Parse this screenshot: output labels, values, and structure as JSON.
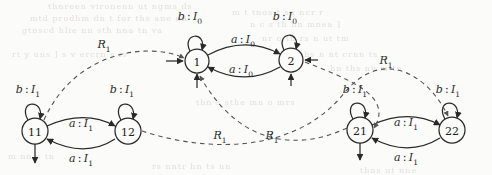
{
  "figure": {
    "type": "state-transition-diagram",
    "colors": {
      "background": "#fbfbf9",
      "stroke": "#2a2a2a",
      "text": "#2a2a2a",
      "bleedthrough": "#e2e0dc"
    }
  },
  "nodes": [
    {
      "id": "n1",
      "label": "1",
      "x": 197,
      "y": 61,
      "r": 12
    },
    {
      "id": "n2",
      "label": "2",
      "x": 291,
      "y": 60,
      "r": 12
    },
    {
      "id": "n11",
      "label": "11",
      "x": 35,
      "y": 131,
      "r": 13
    },
    {
      "id": "n12",
      "label": "12",
      "x": 128,
      "y": 131,
      "r": 13
    },
    {
      "id": "n21",
      "label": "21",
      "x": 360,
      "y": 130,
      "r": 13
    },
    {
      "id": "n22",
      "label": "22",
      "x": 452,
      "y": 130,
      "r": 13
    }
  ],
  "edge_labels": [
    {
      "id": "loop-1",
      "symbol": "b",
      "io": "I",
      "sub": "0",
      "x": 190,
      "y": 18
    },
    {
      "id": "loop-2",
      "symbol": "b",
      "io": "I",
      "sub": "0",
      "x": 285,
      "y": 18
    },
    {
      "id": "top-1to2",
      "symbol": "a",
      "io": "I",
      "sub": "0",
      "x": 243,
      "y": 41
    },
    {
      "id": "bot-2to1",
      "symbol": "a",
      "io": "I",
      "sub": "0",
      "x": 241,
      "y": 71
    },
    {
      "id": "loop-11",
      "symbol": "b",
      "io": "I",
      "sub": "1",
      "x": 28,
      "y": 91
    },
    {
      "id": "loop-12",
      "symbol": "b",
      "io": "I",
      "sub": "1",
      "x": 122,
      "y": 91
    },
    {
      "id": "loop-21",
      "symbol": "b",
      "io": "I",
      "sub": "1",
      "x": 355,
      "y": 91
    },
    {
      "id": "loop-22",
      "symbol": "b",
      "io": "I",
      "sub": "1",
      "x": 448,
      "y": 91
    },
    {
      "id": "top-11to12",
      "symbol": "a",
      "io": "I",
      "sub": "1",
      "x": 81,
      "y": 125
    },
    {
      "id": "bot-12to11",
      "symbol": "a",
      "io": "I",
      "sub": "1",
      "x": 81,
      "y": 160
    },
    {
      "id": "top-21to22",
      "symbol": "a",
      "io": "I",
      "sub": "1",
      "x": 406,
      "y": 124
    },
    {
      "id": "bot-22to21",
      "symbol": "a",
      "io": "I",
      "sub": "1",
      "x": 406,
      "y": 159
    }
  ],
  "relation_labels": [
    {
      "id": "r1-left",
      "symbol": "R",
      "sub": "1",
      "x": 104,
      "y": 46
    },
    {
      "id": "r1-right",
      "symbol": "R",
      "sub": "1",
      "x": 386,
      "y": 62
    },
    {
      "id": "r1-center-left",
      "symbol": "R",
      "sub": "1",
      "x": 220,
      "y": 137
    },
    {
      "id": "r1-center-right",
      "symbol": "R",
      "sub": "1",
      "x": 272,
      "y": 137
    }
  ],
  "bleedthrough_lines": [
    {
      "text": "thnreen  vironenn  ut ngms  ds",
      "x": 48,
      "y": 2
    },
    {
      "text": "mtd prodhm   dn t  for ths ane nn",
      "x": 30,
      "y": 14
    },
    {
      "text": "gtnscd  hlie nn    sth nna tn va",
      "x": 22,
      "y": 26
    },
    {
      "text": "rt  y uns ]",
      "x": 12,
      "y": 50
    },
    {
      "text": "s  v ercrn s  is",
      "x": 62,
      "y": 50
    },
    {
      "text": "m  t  tnos  t  sn ncr r",
      "x": 232,
      "y": 8
    },
    {
      "text": "n  c  s th  hn   mnea ]",
      "x": 250,
      "y": 20
    },
    {
      "text": "nr o  tn rs  n  ut  tm",
      "x": 262,
      "y": 34
    },
    {
      "text": "ths  n  nt   crnn  ts",
      "x": 300,
      "y": 50
    },
    {
      "text": "hn ths ny  m tn",
      "x": 330,
      "y": 64
    },
    {
      "text": "thn  s  sthe mn o mrs",
      "x": 196,
      "y": 98
    },
    {
      "text": "m  nn  s  tn",
      "x": 8,
      "y": 152
    },
    {
      "text": "rs  nntr  hn  ts  nn",
      "x": 152,
      "y": 162
    },
    {
      "text": "thns  ut  nne",
      "x": 360,
      "y": 166
    }
  ]
}
